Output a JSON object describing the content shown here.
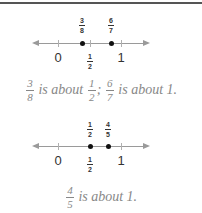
{
  "diagram1": {
    "labels_above": [
      {
        "num": "3",
        "den": "8",
        "x": 82
      },
      {
        "num": "6",
        "den": "7",
        "x": 111
      }
    ],
    "ticks": [
      {
        "label": "0",
        "x": 58
      },
      {
        "num": "1",
        "den": "2",
        "x": 90
      },
      {
        "label": "1",
        "x": 121
      }
    ],
    "caption": {
      "f1_num": "3",
      "f1_den": "8",
      "t1": "is about",
      "f2_num": "1",
      "f2_den": "2",
      "sep": ";",
      "f3_num": "6",
      "f3_den": "7",
      "t2": "is about 1."
    }
  },
  "diagram2": {
    "labels_above": [
      {
        "num": "1",
        "den": "2",
        "x": 90
      },
      {
        "num": "4",
        "den": "5",
        "x": 108
      }
    ],
    "ticks": [
      {
        "label": "0",
        "x": 58
      },
      {
        "num": "1",
        "den": "2",
        "x": 90
      },
      {
        "label": "1",
        "x": 121
      }
    ],
    "caption": {
      "f1_num": "4",
      "f1_den": "5",
      "t1": "is about 1."
    }
  }
}
